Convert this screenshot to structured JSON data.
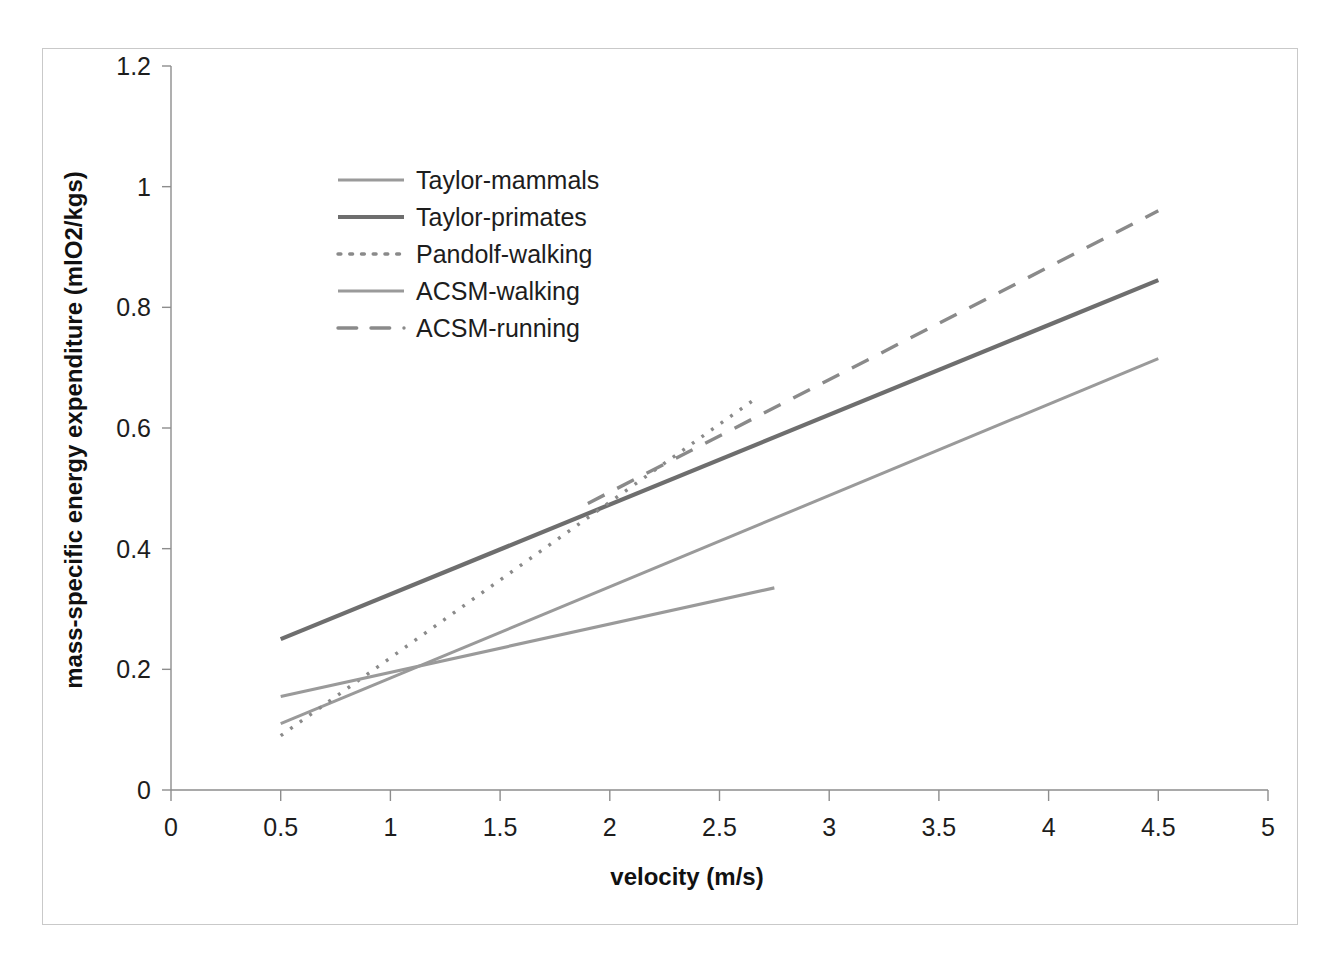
{
  "chart_data": {
    "type": "line",
    "title": "",
    "xlabel": "velocity (m/s)",
    "ylabel": "mass-specific energy expenditure (mlO2/kgs)",
    "xlim": [
      0,
      5
    ],
    "ylim": [
      0,
      1.2
    ],
    "xticks": [
      "0",
      "0.5",
      "1",
      "1.5",
      "2",
      "2.5",
      "3",
      "3.5",
      "4",
      "4.5",
      "5"
    ],
    "xtick_values": [
      0,
      0.5,
      1,
      1.5,
      2,
      2.5,
      3,
      3.5,
      4,
      4.5,
      5
    ],
    "yticks": [
      "0",
      "0.2",
      "0.4",
      "0.6",
      "0.8",
      "1",
      "1.2"
    ],
    "ytick_values": [
      0,
      0.2,
      0.4,
      0.6,
      0.8,
      1,
      1.2
    ],
    "grid": false,
    "legend_position": "upper-left-inside",
    "series": [
      {
        "name": "Taylor-mammals",
        "color": "#9a9a9a",
        "width": 3.0,
        "dash": "none",
        "x": [
          0.5,
          4.5
        ],
        "y": [
          0.11,
          0.715
        ]
      },
      {
        "name": "Taylor-primates",
        "color": "#6e6e6e",
        "width": 4.2,
        "dash": "none",
        "x": [
          0.5,
          4.5
        ],
        "y": [
          0.25,
          0.845
        ]
      },
      {
        "name": "Pandolf-walking",
        "color": "#8a8a8a",
        "width": 3.4,
        "dash": "dotted",
        "x": [
          0.5,
          2.65
        ],
        "y": [
          0.09,
          0.645
        ]
      },
      {
        "name": "ACSM-walking",
        "color": "#9a9a9a",
        "width": 3.2,
        "dash": "none",
        "x": [
          0.5,
          2.75
        ],
        "y": [
          0.155,
          0.335
        ]
      },
      {
        "name": "ACSM-running",
        "color": "#8a8a8a",
        "width": 3.4,
        "dash": "dashed",
        "x": [
          1.9,
          4.5
        ],
        "y": [
          0.475,
          0.96
        ]
      }
    ]
  },
  "legend": {
    "items": [
      {
        "label": "Taylor-mammals",
        "swatch": "line-solid-light"
      },
      {
        "label": "Taylor-primates",
        "swatch": "line-solid-dark"
      },
      {
        "label": "Pandolf-walking",
        "swatch": "line-dotted"
      },
      {
        "label": "ACSM-walking",
        "swatch": "line-solid-medium"
      },
      {
        "label": "ACSM-running",
        "swatch": "line-dashed"
      }
    ]
  },
  "axes": {
    "x_title": "velocity (m/s)",
    "y_title": "mass-specific energy expenditure (mlO2/kgs)"
  },
  "colors": {
    "frame_border": "#c9c9c9",
    "axis": "#8d8d8d",
    "text": "#1d1d1d",
    "background": "#ffffff"
  }
}
